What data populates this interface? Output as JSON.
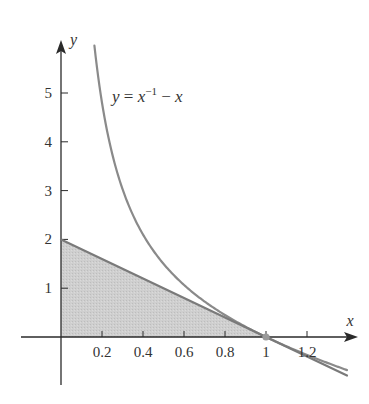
{
  "chart_data": {
    "type": "line",
    "title": "",
    "xlabel": "x",
    "ylabel": "y",
    "xlim": [
      -0.2,
      1.45
    ],
    "ylim": [
      -0.9,
      6.0
    ],
    "grid": false,
    "x_ticks": [
      0.2,
      0.4,
      0.6,
      0.8,
      1,
      1.2
    ],
    "x_tick_labels": [
      "0.2",
      "0.4",
      "0.6",
      "0.8",
      "1",
      "1.2"
    ],
    "y_ticks": [
      1,
      2,
      3,
      4,
      5
    ],
    "y_tick_labels": [
      "1",
      "2",
      "3",
      "4",
      "5"
    ],
    "series": [
      {
        "name": "y = x^-1 - x",
        "kind": "curve",
        "function": "1/x - x",
        "x_range": [
          0.163,
          1.395
        ],
        "color": "#8a8a8a"
      },
      {
        "name": "tangent line y = 2 - 2x",
        "kind": "line",
        "function": "2 - 2x",
        "x_range": [
          0,
          1.395
        ],
        "color": "#7a7a7a"
      }
    ],
    "shaded_region": {
      "description": "triangle under tangent line",
      "vertices": [
        [
          0,
          0
        ],
        [
          0,
          2
        ],
        [
          1,
          0
        ]
      ],
      "color": "#c8c8c8"
    },
    "points": [
      {
        "x": 1,
        "y": 0,
        "color": "#9a9a9a"
      }
    ],
    "annotations": [
      {
        "text_parts": [
          "y",
          " = ",
          "x",
          "−1",
          " − ",
          "x"
        ],
        "x": 0.28,
        "y": 5.0
      }
    ]
  }
}
